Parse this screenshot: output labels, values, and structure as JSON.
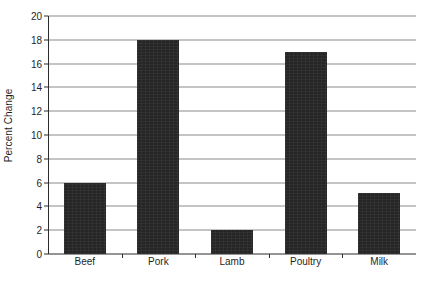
{
  "chart_data": {
    "type": "bar",
    "title": "",
    "subtitle": "",
    "xlabel": "",
    "ylabel": "Percent Change",
    "categories": [
      "Beef",
      "Pork",
      "Lamb",
      "Poultry",
      "Milk"
    ],
    "values": [
      6,
      18,
      2,
      17,
      5.1
    ],
    "ylim": [
      0,
      20
    ],
    "ytick_step": 2,
    "yticks": [
      0,
      2,
      4,
      6,
      8,
      10,
      12,
      14,
      16,
      18,
      20
    ],
    "ytick_labels": [
      "0",
      "2",
      "4",
      "6",
      "8",
      "10",
      "12",
      "14",
      "16",
      "18",
      "20"
    ],
    "grid": true,
    "grid_axis": "y",
    "legend": false,
    "legend_position": "none",
    "annotations": [],
    "series": [
      {
        "name": "Percent Change",
        "values": [
          6,
          18,
          2,
          17,
          5.1
        ]
      }
    ],
    "colors": {
      "bar_fill": "#262626",
      "gridline": "#8a8a8a",
      "axis_line": "#2b2b2b",
      "background": "#ffffff",
      "text": "#1f1f1f"
    }
  }
}
